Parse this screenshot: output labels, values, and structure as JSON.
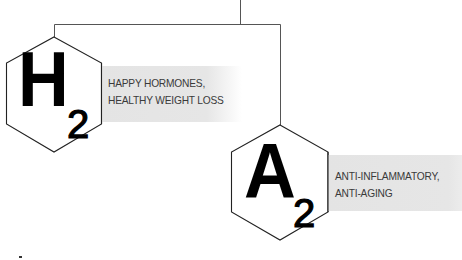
{
  "diagram": {
    "connector": {
      "stroke": "#555555"
    },
    "nodes": [
      {
        "id": "h2",
        "symbol": "H",
        "subscript": "2",
        "description_lines": [
          "HAPPY HORMONES,",
          "HEALTHY WEIGHT LOSS"
        ]
      },
      {
        "id": "a2",
        "symbol": "A",
        "subscript": "2",
        "description_lines": [
          "ANTI-INFLAMMATORY,",
          "ANTI-AGING"
        ]
      }
    ],
    "colors": {
      "hexagon_stroke": "#222222",
      "band_fill": "#e5e5e5",
      "text": "#3a3a3a",
      "symbol": "#000000"
    }
  }
}
